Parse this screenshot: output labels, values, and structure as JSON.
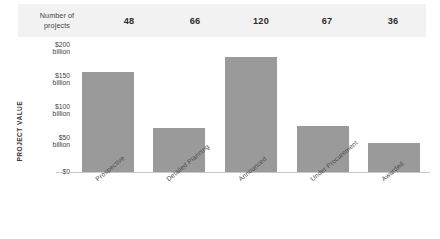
{
  "header": {
    "row_label": "Number of\nprojects",
    "row_label_line1": "Number of",
    "row_label_line2": "projects",
    "counts": [
      "48",
      "66",
      "120",
      "67",
      "36"
    ]
  },
  "axis": {
    "y_title": "PROJECT VALUE",
    "y_ticks": [
      {
        "line1": "$200",
        "line2": "billion",
        "value": 200
      },
      {
        "line1": "$150",
        "line2": "billion",
        "value": 150
      },
      {
        "line1": "$100",
        "line2": "billion",
        "value": 100
      },
      {
        "line1": "$50",
        "line2": "billion",
        "value": 50
      },
      {
        "line1": "$0",
        "line2": "",
        "value": 0
      }
    ]
  },
  "colors": {
    "bar": "#9a9a9a",
    "header_band": "#f2f2f2",
    "baseline": "#c9c9c9",
    "text": "#3f3f3f"
  },
  "chart_data": {
    "type": "bar",
    "title": "",
    "xlabel": "",
    "ylabel": "PROJECT VALUE",
    "ylim": [
      0,
      200
    ],
    "ytick_values": [
      0,
      50,
      100,
      150,
      200
    ],
    "ytick_labels": [
      "$0",
      "$50 billion",
      "$100 billion",
      "$150 billion",
      "$200 billion"
    ],
    "y_unit": "billion USD",
    "grid": false,
    "legend": "none",
    "categories": [
      "Prospective",
      "Detailed Planning",
      "Announced",
      "Under Procurement",
      "Awarded"
    ],
    "values": [
      161,
      71,
      185,
      74,
      47
    ],
    "annotations": {
      "row_header": "Number of projects",
      "project_counts": [
        48,
        66,
        120,
        67,
        36
      ]
    }
  }
}
